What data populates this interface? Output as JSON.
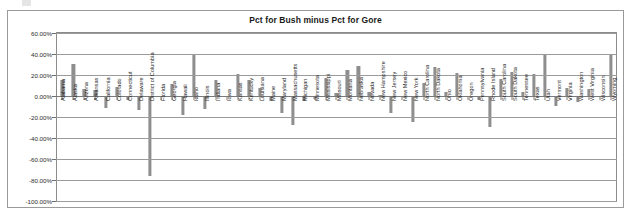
{
  "chart_data": {
    "type": "bar",
    "title": "Pct for Bush minus Pct for Gore",
    "xlabel": "",
    "ylabel": "",
    "ylim": [
      -100,
      60
    ],
    "ytick_labels": [
      "60.00%",
      "40.00%",
      "20.00%",
      "0.00%",
      "-20.00%",
      "-40.00%",
      "-60.00%",
      "-80.00%",
      "-100.00%"
    ],
    "ytick_values": [
      60,
      40,
      20,
      0,
      -20,
      -40,
      -60,
      -80,
      -100
    ],
    "grid": true,
    "legend": "none",
    "bar_color": "#8e8e8e",
    "categories": [
      "Alabama",
      "Alaska",
      "Arizona",
      "Arkansas",
      "California",
      "Colorado",
      "Connecticut",
      "Delaware",
      "District of Columbia",
      "Florida",
      "Georgia",
      "Hawaii",
      "Idaho",
      "Illinois",
      "Indiana",
      "Iowa",
      "Kansas",
      "Kentucky",
      "Louisiana",
      "Maine",
      "Maryland",
      "Massachusetts",
      "Michigan",
      "Minnesota",
      "Mississippi",
      "Missouri",
      "Montana",
      "Nebraska",
      "Nevada",
      "New Hampshire",
      "New Jersey",
      "New Mexico",
      "New York",
      "North Carolina",
      "North Dakota",
      "Ohio",
      "Oklahoma",
      "Oregon",
      "Pennsylvania",
      "Rhode Island",
      "South Carolina",
      "South Dakota",
      "Tennessee",
      "Texas",
      "Utah",
      "Vermont",
      "Virginia",
      "Washington",
      "West Virginia",
      "Wisconsin",
      "Wyoming"
    ],
    "values": [
      14.9,
      30.2,
      6.3,
      5.4,
      -11.8,
      8.4,
      -3.6,
      -13.1,
      -76.2,
      0.0,
      11.7,
      -18.3,
      39.5,
      -12.0,
      15.7,
      0.3,
      20.8,
      15.1,
      7.6,
      -5.1,
      -16.2,
      -27.3,
      -5.1,
      -2.4,
      16.9,
      3.3,
      25.0,
      29.0,
      3.5,
      1.3,
      -15.8,
      -0.1,
      -25.0,
      12.8,
      27.6,
      3.5,
      21.9,
      -0.4,
      -4.2,
      -29.1,
      16.0,
      22.7,
      3.8,
      21.3,
      40.4,
      -9.9,
      8.0,
      -5.6,
      6.3,
      -0.2,
      40.1
    ]
  }
}
